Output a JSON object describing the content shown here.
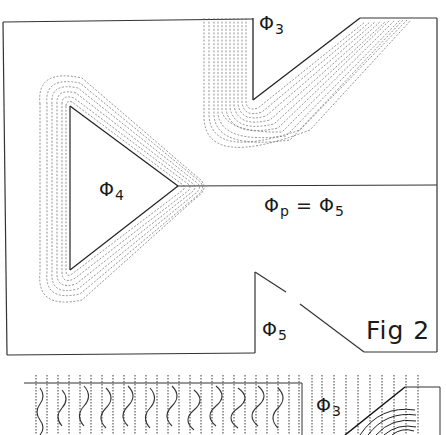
{
  "figure": {
    "caption": "Fig 2",
    "regions": {
      "phi3": {
        "symbol": "Φ",
        "subscript": "3"
      },
      "phi4": {
        "symbol": "Φ",
        "subscript": "4"
      },
      "phi5": {
        "symbol": "Φ",
        "subscript": "5"
      },
      "boundary_condition": {
        "lhs_symbol": "Φ",
        "lhs_subscript": "p",
        "equals": "=",
        "rhs_symbol": "Φ",
        "rhs_subscript": "5"
      }
    },
    "inset": {
      "label": {
        "symbol": "Φ",
        "subscript": "3"
      }
    },
    "colors": {
      "ink": "#1a1a1a",
      "contour": "#555555",
      "background": "#ffffff"
    }
  }
}
